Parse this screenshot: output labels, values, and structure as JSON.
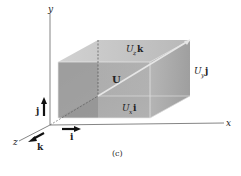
{
  "figure": {
    "caption": "(c)",
    "axes": {
      "x_label": "x",
      "y_label": "y",
      "z_label": "z"
    },
    "unit_vectors": {
      "i": "i",
      "j": "j",
      "k": "k"
    },
    "vector": {
      "label": "U",
      "components": {
        "x": {
          "base": "U",
          "sub": "x",
          "unit": "i"
        },
        "y": {
          "base": "U",
          "sub": "y",
          "unit": "j"
        },
        "z": {
          "base": "U",
          "sub": "z",
          "unit": "k"
        }
      }
    },
    "colors": {
      "front_face": "#9a9a9a",
      "top_face": "#c8c8c8",
      "right_face": "#a8a8a8",
      "bottom_face": "#bdbdbd",
      "axis": "#555555",
      "arrow": "#111111"
    }
  }
}
